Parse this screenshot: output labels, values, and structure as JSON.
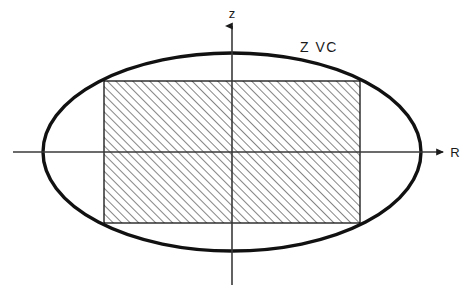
{
  "figure": {
    "background_color": "#ffffff",
    "ink_color": "#111111",
    "axis_color": "#3a3a3a",
    "hatch_color": "#2b2b2b",
    "width": 473,
    "height": 287
  },
  "axes": {
    "origin": {
      "x": 232,
      "y": 152
    },
    "vertical": {
      "label": "z",
      "label_x": 232,
      "label_y": 18,
      "x": 232,
      "y_top": 26,
      "y_bottom": 285,
      "arrow": "up",
      "stroke_width": 1.6
    },
    "horizontal": {
      "label": "R",
      "label_x": 455,
      "label_y": 157,
      "y": 152,
      "x_left": 13,
      "x_right": 443,
      "arrow": "right",
      "stroke_width": 1.6
    }
  },
  "ellipse": {
    "name": "zero-velocity-curve",
    "label": "Z VC",
    "label_x": 300,
    "label_y": 52,
    "center_x": 232,
    "center_y": 152,
    "radius_x": 189,
    "radius_y": 99,
    "stroke_width": 3.4
  },
  "rectangle": {
    "name": "hatched-region",
    "left": 104,
    "top": 81,
    "right": 360,
    "bottom": 223,
    "width": 256,
    "height": 142,
    "stroke_width": 1.3,
    "fill": "hatch-45",
    "hatch_angle_deg": 45,
    "hatch_spacing": 6
  },
  "legend": {
    "zvc_meaning": "Z VC"
  }
}
